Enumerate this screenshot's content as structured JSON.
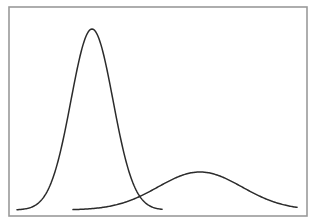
{
  "chart_data": {
    "type": "line",
    "title": "",
    "xlabel": "",
    "ylabel": "",
    "grid": false,
    "legend": null,
    "axis_ticks": "none",
    "frame": {
      "left": 9,
      "top": 7,
      "right": 307,
      "bottom": 216,
      "color": "#9a9a9a"
    },
    "series": [
      {
        "name": "narrow-distribution",
        "color": "#2b2b2b",
        "shape": "gaussian",
        "mean_px": 92,
        "sigma_px": 21,
        "peak_y_px": 29,
        "baseline_y_px": 210,
        "x_start_px": 17,
        "x_end_px": 162
      },
      {
        "name": "wide-distribution",
        "color": "#2b2b2b",
        "shape": "gaussian",
        "mean_px": 200,
        "sigma_px": 42,
        "peak_y_px": 172,
        "baseline_y_px": 210,
        "x_start_px": 73,
        "x_end_px": 297
      }
    ],
    "annotations": []
  }
}
